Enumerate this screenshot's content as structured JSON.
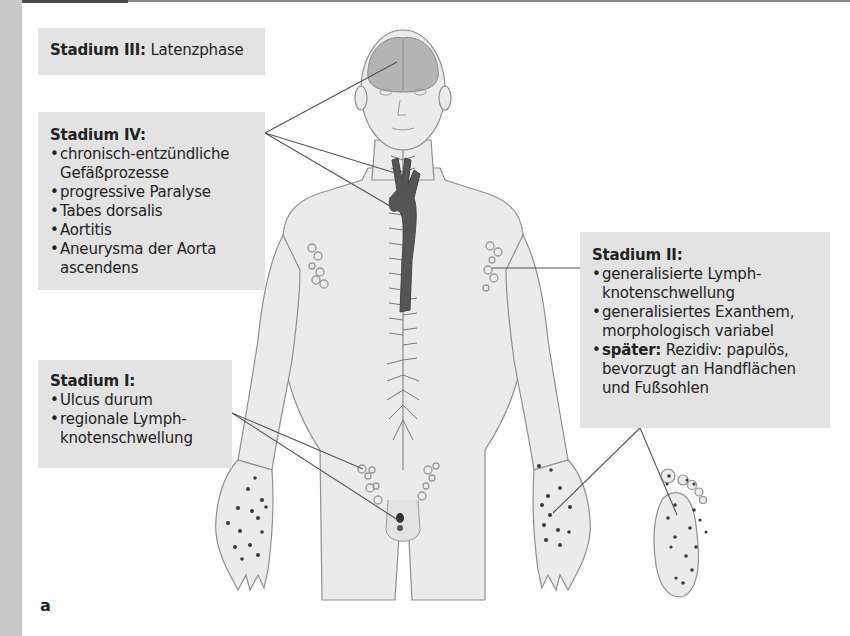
{
  "figure": {
    "panel_label": "a",
    "colors": {
      "box_bg": "#e3e3e3",
      "skin": "#e8e8e8",
      "outline": "#8f8f8f",
      "aorta": "#555555",
      "lesion": "#3a3a3a",
      "left_strip": "#c9c9c9"
    }
  },
  "stages": {
    "stage3": {
      "title": "Stadium III:",
      "text": "Latenzphase"
    },
    "stage4": {
      "title": "Stadium IV:",
      "items": [
        "chronisch-entzündliche Gefäßprozesse",
        "progressive Paralyse",
        "Tabes dorsalis",
        "Aortitis",
        "Aneurysma der Aorta ascendens"
      ]
    },
    "stage1": {
      "title": "Stadium I:",
      "items": [
        "Ulcus durum",
        "regionale Lymph-knotenschwellung"
      ]
    },
    "stage2": {
      "title": "Stadium II:",
      "items": [
        "generalisierte Lymph-knotenschwellung",
        "generalisiertes Exanthem, morphologisch variabel"
      ],
      "later_label": "später:",
      "later_text": "Rezidiv: papulös, bevorzugt an Handflächen und Fußsohlen"
    }
  }
}
